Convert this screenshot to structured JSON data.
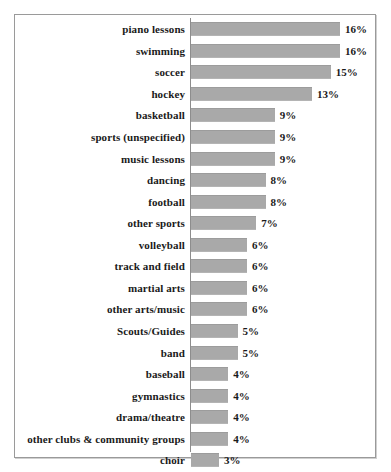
{
  "chart_data": {
    "type": "bar",
    "orientation": "horizontal",
    "title": "",
    "subtitle": "",
    "xlabel": "",
    "ylabel": "",
    "grid": false,
    "legend": null,
    "xlim": [
      0,
      16
    ],
    "value_suffix": "%",
    "categories": [
      "piano lessons",
      "swimming",
      "soccer",
      "hockey",
      "basketball",
      "sports (unspecified)",
      "music lessons",
      "dancing",
      "football",
      "other sports",
      "volleyball",
      "track and field",
      "martial arts",
      "other arts/music",
      "Scouts/Guides",
      "band",
      "baseball",
      "gymnastics",
      "drama/theatre",
      "other clubs & community groups",
      "choir"
    ],
    "values": [
      16,
      16,
      15,
      13,
      9,
      9,
      9,
      8,
      8,
      7,
      6,
      6,
      6,
      6,
      5,
      5,
      4,
      4,
      4,
      4,
      3
    ],
    "data_labels": [
      "16%",
      "16%",
      "15%",
      "13%",
      "9%",
      "9%",
      "9%",
      "8%",
      "8%",
      "7%",
      "6%",
      "6%",
      "6%",
      "6%",
      "5%",
      "5%",
      "4%",
      "4%",
      "4%",
      "4%",
      "3%"
    ],
    "bar_color": "#a9a9a9",
    "frame_color": "#9a9a9a",
    "axis_color": "#8d8d8d",
    "text_color": "#1a1a1a",
    "background": "#ffffff"
  }
}
